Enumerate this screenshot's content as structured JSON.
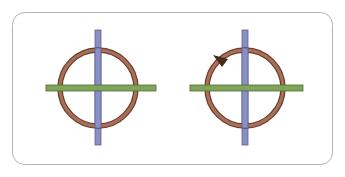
{
  "diagram": {
    "colors": {
      "background": "#ffffff",
      "frame_stroke": "#b5b5b5",
      "ring_outer": "#6b3f2a",
      "ring_fill": "#a8705a",
      "vertical_rod": "#8a8fc4",
      "vertical_rod_edge": "#5d6296",
      "horizontal_rod": "#7fa45a",
      "horizontal_rod_edge": "#4f6e36",
      "arrow": "#4a2a1a"
    },
    "figures": [
      {
        "name": "left",
        "cx": 98,
        "cy": 88,
        "r": 38,
        "vrod_x": 98,
        "vrod_y1": 30,
        "vrod_y2": 145,
        "hrod_y": 88,
        "hrod_x1": 46,
        "hrod_x2": 156,
        "arrow": false
      },
      {
        "name": "right",
        "cx": 245,
        "cy": 88,
        "r": 38,
        "vrod_x": 245,
        "vrod_y1": 30,
        "vrod_y2": 145,
        "hrod_y": 88,
        "hrod_x1": 190,
        "hrod_x2": 303,
        "arrow": true
      }
    ]
  }
}
